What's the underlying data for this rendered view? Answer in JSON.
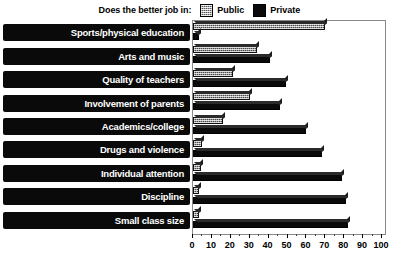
{
  "legend": {
    "title": "Does the better job in:",
    "entries": [
      {
        "label": "Public",
        "icon": "hatched-gray-swatch",
        "color": "#555555"
      },
      {
        "label": "Private",
        "icon": "solid-black-swatch",
        "color": "#0a0a0a"
      }
    ]
  },
  "chart_data": {
    "type": "bar",
    "orientation": "horizontal",
    "title": "Does the better job in:",
    "xlabel": "",
    "ylabel": "",
    "xlim": [
      0,
      100
    ],
    "xticks": [
      0,
      10,
      20,
      30,
      40,
      50,
      60,
      70,
      80,
      90,
      100
    ],
    "grid": false,
    "legend_position": "top-center",
    "categories": [
      "Sports/physical education",
      "Arts and music",
      "Quality of teachers",
      "Involvement of parents",
      "Academics/college",
      "Drugs and violence",
      "Individual attention",
      "Discipline",
      "Small class size"
    ],
    "series": [
      {
        "name": "Public",
        "values": [
          70,
          34,
          21,
          30,
          16,
          5,
          4,
          3,
          3
        ]
      },
      {
        "name": "Private",
        "values": [
          3,
          41,
          49,
          46,
          60,
          68,
          79,
          81,
          82
        ]
      }
    ]
  },
  "axis": {
    "ticklabels": [
      "0",
      "10",
      "20",
      "30",
      "40",
      "50",
      "60",
      "70",
      "80",
      "90",
      "100"
    ]
  }
}
